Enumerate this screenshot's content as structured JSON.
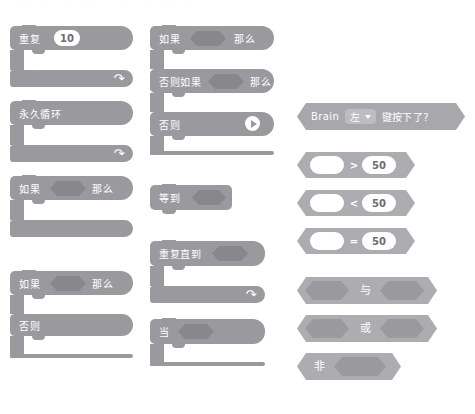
{
  "top_clipped_text": "· · ·· ···· ··· ·· · ···· ·· ·· ··· · ···· ·· ···· ·· ····· ··",
  "palette": {
    "control_color": "#9a9a9e",
    "control_slot_color": "#88888c",
    "sensing_color": "#a8a8ac",
    "sensing_dropdown_color": "#bdbdc1",
    "operator_color": "#adadb1",
    "operator_slot_color": "#9a9a9e",
    "input_text_color": "#6b6b70"
  },
  "columns": {
    "left": {
      "blocks": [
        {
          "id": "repeat",
          "label": "重复",
          "value": "10",
          "kind": "c-block-loop"
        },
        {
          "id": "forever",
          "label": "永久循环",
          "kind": "c-block-loop"
        },
        {
          "id": "if-then",
          "label_if": "如果",
          "label_then": "那么",
          "kind": "c-block-if"
        },
        {
          "id": "if-then-else",
          "label_if": "如果",
          "label_then": "那么",
          "label_else": "否则",
          "kind": "c-block-if-else"
        }
      ]
    },
    "middle": {
      "blocks": [
        {
          "id": "if-elseif-else",
          "label_if": "如果",
          "label_then": "那么",
          "label_elseif": "否则如果",
          "label_elseif_then": "那么",
          "label_else": "否则",
          "kind": "c-block-if-elseif",
          "expand_icon": "expand-arrow-icon"
        },
        {
          "id": "wait-until",
          "label": "等到",
          "kind": "stack-hat"
        },
        {
          "id": "repeat-until",
          "label": "重复直到",
          "kind": "c-block-loop"
        },
        {
          "id": "when",
          "label": "当",
          "kind": "c-block"
        }
      ]
    },
    "right": {
      "blocks": [
        {
          "id": "brain-key-pressed",
          "prefix": "Brain",
          "dropdown": "左",
          "suffix": "键按下了?",
          "kind": "boolean-sensing",
          "dropdown_icon": "chevron-down-icon"
        },
        {
          "id": "greater-than",
          "operator": ">",
          "left_value": "",
          "right_value": "50",
          "kind": "boolean-operator"
        },
        {
          "id": "less-than",
          "operator": "<",
          "left_value": "",
          "right_value": "50",
          "kind": "boolean-operator"
        },
        {
          "id": "equals",
          "operator": "=",
          "left_value": "",
          "right_value": "50",
          "kind": "boolean-operator"
        },
        {
          "id": "and",
          "label": "与",
          "kind": "boolean-logic"
        },
        {
          "id": "or",
          "label": "或",
          "kind": "boolean-logic"
        },
        {
          "id": "not",
          "label": "非",
          "kind": "boolean-logic-unary"
        }
      ]
    }
  }
}
